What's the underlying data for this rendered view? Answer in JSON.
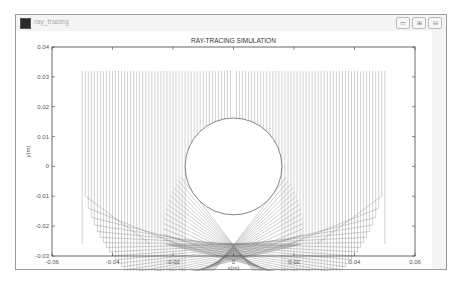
{
  "window": {
    "title": "ray_tracing",
    "controls": [
      {
        "name": "minimize",
        "glyph": "▭"
      },
      {
        "name": "maximize",
        "glyph": "⊞"
      },
      {
        "name": "close",
        "glyph": "⊟"
      }
    ]
  },
  "plot": {
    "title": "RAY-TRACING SIMULATION",
    "xlabel": "x(m)",
    "ylabel": "y(m)"
  },
  "chart_data": {
    "type": "line",
    "title": "RAY-TRACING SIMULATION",
    "xlabel": "x(m)",
    "ylabel": "y(m)",
    "xlim": [
      -0.06,
      0.06
    ],
    "ylim": [
      -0.03,
      0.04
    ],
    "xticks": [
      "-0.06",
      "-0.04",
      "-0.02",
      "0",
      "0.02",
      "0.04",
      "0.06"
    ],
    "yticks": [
      "0.04",
      "0.03",
      "0.02",
      "0.01",
      "0",
      "-0.01",
      "-0.02",
      "-0.03"
    ],
    "grid": false,
    "legend": null,
    "elements": {
      "sphere": {
        "center": [
          0,
          0
        ],
        "radius": 0.016
      },
      "rays": {
        "x_start": -0.05,
        "x_end": 0.05,
        "y_start": 0.032,
        "count": 100,
        "direction": "downward"
      },
      "outer_mirror": {
        "shape": "semicircle",
        "center": [
          0,
          0.0
        ],
        "radius": 0.05
      },
      "caustic_focus": [
        0,
        -0.0165
      ],
      "envelope_min_y": -0.024
    }
  }
}
